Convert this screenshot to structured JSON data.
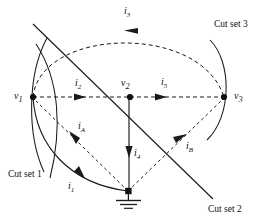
{
  "figure": {
    "background_color": "#ffffff",
    "stroke_color": "#1a1a1a",
    "width": 278,
    "height": 223
  },
  "nodes": [
    {
      "id": "v1",
      "label": "v",
      "sub": "1",
      "x": 33,
      "y": 97,
      "label_x": 14,
      "label_y": 91
    },
    {
      "id": "v2",
      "label": "v",
      "sub": "2",
      "x": 130,
      "y": 97,
      "label_x": 121,
      "label_y": 78
    },
    {
      "id": "v3",
      "label": "v",
      "sub": "3",
      "x": 224,
      "y": 97,
      "label_x": 234,
      "label_y": 91
    },
    {
      "id": "ground",
      "label": "",
      "sub": "",
      "x": 128,
      "y": 191,
      "label_x": 0,
      "label_y": 0
    }
  ],
  "branch_currents": [
    {
      "id": "i1",
      "label": "i",
      "sub": "1",
      "label_x": 68,
      "label_y": 181,
      "style": "solid"
    },
    {
      "id": "i2",
      "label": "i",
      "sub": "2",
      "label_x": 75,
      "label_y": 78,
      "style": "dashed"
    },
    {
      "id": "i3",
      "label": "i",
      "sub": "3",
      "label_x": 124,
      "label_y": 6,
      "style": "dashed"
    },
    {
      "id": "i4",
      "label": "i",
      "sub": "4",
      "label_x": 134,
      "label_y": 148,
      "style": "solid"
    },
    {
      "id": "i5",
      "label": "i",
      "sub": "5",
      "label_x": 161,
      "label_y": 77,
      "style": "dashed"
    },
    {
      "id": "iA",
      "label": "i",
      "sub": "A",
      "label_x": 78,
      "label_y": 121,
      "style": "dashed"
    },
    {
      "id": "iB",
      "label": "i",
      "sub": "B",
      "label_x": 186,
      "label_y": 141,
      "style": "dashed"
    }
  ],
  "cut_sets": [
    {
      "id": "cut-set-1",
      "label": "Cut set 1",
      "label_x": 8,
      "label_y": 170,
      "shape": "lens-arc-left"
    },
    {
      "id": "cut-set-2",
      "label": "Cut set 2",
      "label_x": 208,
      "label_y": 205,
      "shape": "diagonal-line"
    },
    {
      "id": "cut-set-3",
      "label": "Cut set 3",
      "label_x": 214,
      "label_y": 20,
      "shape": "arc-right"
    }
  ],
  "ground_symbol": {
    "id": "ground-symbol",
    "x": 128,
    "y": 191,
    "bars": 3
  }
}
